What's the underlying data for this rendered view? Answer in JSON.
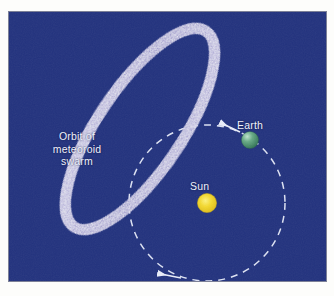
{
  "figure": {
    "type": "astronomy-diagram",
    "background_color": "#ffffff",
    "panel_color": "#22327e"
  },
  "labels": {
    "orbit_of_meteoroid_swarm": "Orbit of\nmeteoroid\nswarm",
    "sun": "Sun",
    "earth": "Earth"
  },
  "colors": {
    "panel_navy": "#22327e",
    "meteoroid_band": "#b9b3de",
    "meteoroid_speckle": "#ffffff",
    "sun_yellow": "#f2d52e",
    "sun_rim": "#d9b61c",
    "earth_green": "#3e8f6a",
    "earth_highlight": "#a8d9bd",
    "orbit_dash": "#e8ecfa",
    "label_text": "#eef0fb"
  },
  "bodies": [
    {
      "name": "sun",
      "label": "Sun",
      "cx": 198,
      "cy": 191,
      "r": 9.5,
      "fill": "#f2d52e"
    },
    {
      "name": "earth",
      "label": "Earth",
      "cx": 241,
      "cy": 128,
      "r": 8.5,
      "fill": "#3e8f6a"
    }
  ],
  "orbits": [
    {
      "name": "earth-orbit",
      "style": "dashed-circle",
      "cx": 198,
      "cy": 191,
      "r": 78,
      "stroke": "#e8ecfa",
      "dash": "7 6",
      "direction": "clockwise",
      "arrowheads": 2
    },
    {
      "name": "meteoroid-swarm-orbit",
      "style": "speckled-ellipse",
      "cx": 131,
      "cy": 117,
      "rx": 118,
      "ry": 42,
      "rotation_deg": -56,
      "band_color": "#b9b3de",
      "band_width": 11
    }
  ],
  "annotations": {
    "arrow_near_earth": "direction-of-earth-motion",
    "arrow_bottom": "direction-of-earth-motion"
  }
}
